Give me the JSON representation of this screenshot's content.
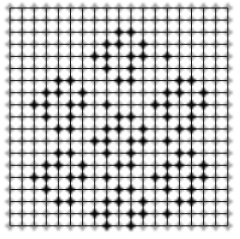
{
  "figure": {
    "name": "lattice-grid-diagram",
    "type": "grid-marker-lattice",
    "width": 240,
    "height": 239,
    "background_color": "#ffffff"
  },
  "grid": {
    "columns": 18,
    "rows": 18,
    "cell_size": 12.1,
    "origin_x": 10,
    "origin_y": 8,
    "line_color": "#1a1a1a",
    "line_width": 1,
    "grid_visible": true
  },
  "markers": {
    "shape": "cross-plus",
    "size": 9,
    "arm_thickness": 3,
    "inactive_color": "#9a9a9a",
    "active_color": "#000000",
    "blur": 0.9,
    "rows": 19,
    "columns": 19,
    "note": "A cross marker sits at every grid intersection including the outer border ring."
  },
  "chart_data": {
    "type": "heatmap",
    "title": "",
    "subtitle": "",
    "xlabel": "",
    "ylabel": "",
    "xlim": [
      0,
      18
    ],
    "ylim": [
      0,
      18
    ],
    "grid": true,
    "legend": "none",
    "categories": [],
    "values": [],
    "active_cells": [
      [
        9,
        2
      ],
      [
        10,
        2
      ],
      [
        8,
        3
      ],
      [
        9,
        3
      ],
      [
        11,
        3
      ],
      [
        7,
        4
      ],
      [
        8,
        4
      ],
      [
        10,
        4
      ],
      [
        11,
        4
      ],
      [
        13,
        4
      ],
      [
        8,
        5
      ],
      [
        10,
        5
      ],
      [
        9,
        6
      ],
      [
        10,
        6
      ],
      [
        4,
        6
      ],
      [
        5,
        6
      ],
      [
        3,
        7
      ],
      [
        4,
        7
      ],
      [
        6,
        7
      ],
      [
        14,
        6
      ],
      [
        15,
        6
      ],
      [
        13,
        7
      ],
      [
        14,
        7
      ],
      [
        16,
        7
      ],
      [
        2,
        8
      ],
      [
        3,
        8
      ],
      [
        5,
        8
      ],
      [
        6,
        8
      ],
      [
        8,
        8
      ],
      [
        12,
        8
      ],
      [
        13,
        8
      ],
      [
        15,
        8
      ],
      [
        16,
        8
      ],
      [
        3,
        9
      ],
      [
        5,
        9
      ],
      [
        13,
        9
      ],
      [
        15,
        9
      ],
      [
        4,
        10
      ],
      [
        5,
        10
      ],
      [
        14,
        10
      ],
      [
        15,
        10
      ],
      [
        9,
        9
      ],
      [
        10,
        9
      ],
      [
        8,
        10
      ],
      [
        9,
        10
      ],
      [
        11,
        10
      ],
      [
        7,
        11
      ],
      [
        8,
        11
      ],
      [
        10,
        11
      ],
      [
        11,
        11
      ],
      [
        13,
        11
      ],
      [
        8,
        12
      ],
      [
        10,
        12
      ],
      [
        9,
        13
      ],
      [
        10,
        13
      ],
      [
        4,
        12
      ],
      [
        5,
        12
      ],
      [
        3,
        13
      ],
      [
        4,
        13
      ],
      [
        6,
        13
      ],
      [
        14,
        12
      ],
      [
        15,
        12
      ],
      [
        13,
        13
      ],
      [
        14,
        13
      ],
      [
        16,
        13
      ],
      [
        2,
        14
      ],
      [
        3,
        14
      ],
      [
        5,
        14
      ],
      [
        6,
        14
      ],
      [
        8,
        14
      ],
      [
        12,
        14
      ],
      [
        13,
        14
      ],
      [
        15,
        14
      ],
      [
        16,
        14
      ],
      [
        3,
        15
      ],
      [
        5,
        15
      ],
      [
        13,
        15
      ],
      [
        15,
        15
      ],
      [
        4,
        16
      ],
      [
        5,
        16
      ],
      [
        14,
        16
      ],
      [
        15,
        16
      ],
      [
        9,
        15
      ],
      [
        10,
        15
      ],
      [
        8,
        16
      ],
      [
        9,
        16
      ],
      [
        11,
        16
      ],
      [
        7,
        17
      ],
      [
        8,
        17
      ],
      [
        10,
        17
      ],
      [
        11,
        17
      ],
      [
        13,
        17
      ],
      [
        8,
        18
      ],
      [
        10,
        18
      ]
    ],
    "cluster_count": 7,
    "cluster_centers": [
      [
        9,
        4
      ],
      [
        4,
        8
      ],
      [
        14,
        8
      ],
      [
        9,
        11
      ],
      [
        4,
        14
      ],
      [
        14,
        14
      ],
      [
        9,
        16
      ]
    ]
  }
}
